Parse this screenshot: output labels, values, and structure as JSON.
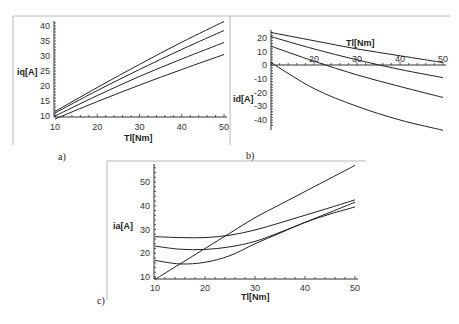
{
  "chart_data": [
    {
      "panel": "a)",
      "type": "line",
      "xlabel": "Tl[Nm]",
      "ylabel": "iq[A]",
      "xlim": [
        10,
        50
      ],
      "ylim": [
        10,
        40
      ],
      "xticks": [
        10,
        20,
        30,
        40,
        50
      ],
      "yticks": [
        10,
        15,
        20,
        25,
        30,
        35,
        40
      ],
      "grid": false,
      "x": [
        10,
        20,
        30,
        40,
        50
      ],
      "series": [
        {
          "name": "curve-1",
          "values": [
            11.5,
            19.5,
            27.2,
            34.6,
            41.5
          ]
        },
        {
          "name": "curve-2",
          "values": [
            11.0,
            18.5,
            25.5,
            32.2,
            38.5
          ]
        },
        {
          "name": "curve-3",
          "values": [
            10.0,
            16.8,
            23.2,
            29.0,
            34.5
          ]
        },
        {
          "name": "curve-4",
          "values": [
            9.0,
            14.8,
            20.3,
            25.5,
            30.5
          ]
        }
      ]
    },
    {
      "panel": "b)",
      "type": "line",
      "xlabel": "Tl[Nm]",
      "ylabel": "id[A]",
      "xlim": [
        10,
        50
      ],
      "ylim": [
        -45,
        25
      ],
      "xticks": [
        20,
        30,
        40,
        50
      ],
      "yticks": [
        20,
        10,
        0,
        -10,
        -20,
        -30,
        -40
      ],
      "grid": false,
      "x": [
        10,
        20,
        30,
        40,
        50
      ],
      "series": [
        {
          "name": "curve-1",
          "values": [
            24,
            18,
            12,
            7,
            2
          ]
        },
        {
          "name": "curve-2",
          "values": [
            21,
            12,
            4,
            -3,
            -9
          ]
        },
        {
          "name": "curve-3",
          "values": [
            14,
            3,
            -7,
            -15.5,
            -23.5
          ]
        },
        {
          "name": "curve-4",
          "values": [
            2,
            -17,
            -30,
            -40,
            -47.5
          ]
        }
      ]
    },
    {
      "panel": "c)",
      "type": "line",
      "xlabel": "Tl[Nm]",
      "ylabel": "ia[A]",
      "xlim": [
        10,
        50
      ],
      "ylim": [
        10,
        57
      ],
      "xticks": [
        10,
        20,
        30,
        40,
        50
      ],
      "yticks": [
        10,
        20,
        30,
        40,
        50
      ],
      "grid": false,
      "x": [
        10,
        15,
        20,
        25,
        30,
        35,
        40,
        45,
        50
      ],
      "series": [
        {
          "name": "curve-1",
          "values": [
            27,
            26.6,
            26.6,
            27.6,
            29.8,
            32.8,
            36,
            39.2,
            42.5
          ]
        },
        {
          "name": "curve-2",
          "values": [
            23,
            21.7,
            21.6,
            22.7,
            25,
            28.8,
            33,
            37.2,
            41.5
          ]
        },
        {
          "name": "curve-3",
          "values": [
            17,
            15.5,
            16.2,
            19,
            24,
            28.5,
            33,
            36.5,
            39.5
          ]
        },
        {
          "name": "curve-4",
          "values": [
            9,
            15.5,
            22,
            28.5,
            35,
            40.5,
            46,
            51.5,
            57
          ]
        }
      ]
    }
  ],
  "labels": {
    "panel_a": "a)",
    "panel_b": "b)",
    "panel_c": "c)",
    "a_xlabel": "Tl[Nm]",
    "a_ylabel": "iq[A]",
    "b_xlabel": "Tl[Nm]",
    "b_ylabel": "id[A]",
    "c_xlabel": "Tl[Nm]",
    "c_ylabel": "ia[A]"
  },
  "ticks": {
    "a_x": [
      "10",
      "20",
      "30",
      "40",
      "50"
    ],
    "a_y": [
      "10",
      "15",
      "20",
      "25",
      "30",
      "35",
      "40"
    ],
    "b_x": [
      "20",
      "30",
      "40",
      "50"
    ],
    "b_y": [
      "20",
      "10",
      "0",
      "-10",
      "-20",
      "-30",
      "-40"
    ],
    "c_x": [
      "10",
      "20",
      "30",
      "40",
      "50"
    ],
    "c_y": [
      "10",
      "20",
      "30",
      "40",
      "50"
    ]
  }
}
